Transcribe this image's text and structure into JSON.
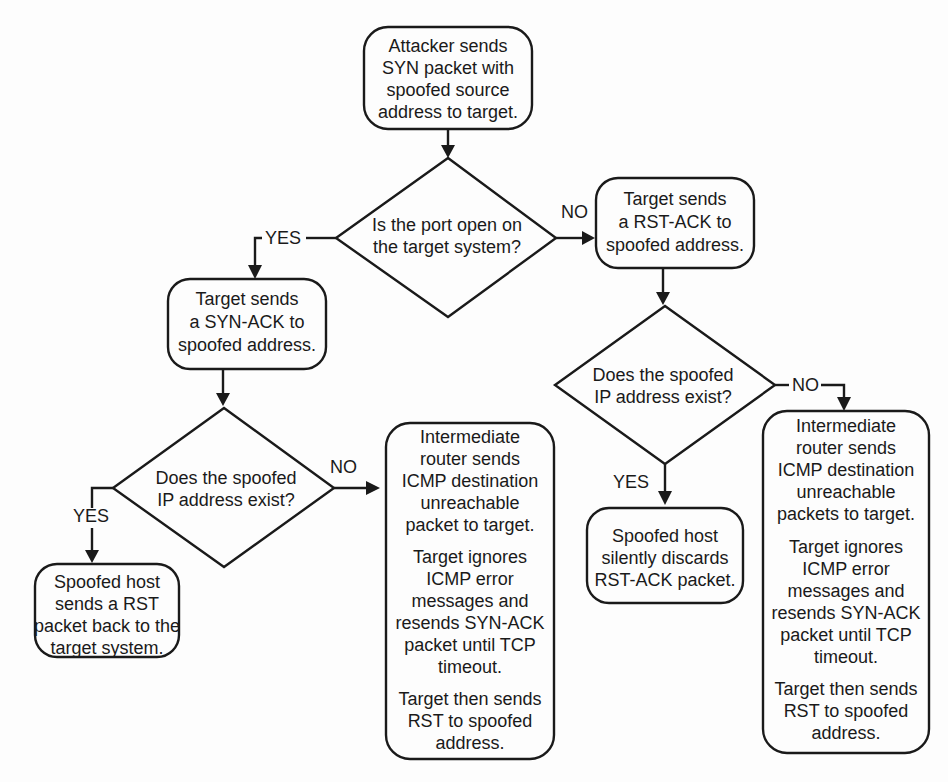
{
  "diagram": {
    "type": "flowchart",
    "start": {
      "lines": [
        "Attacker sends",
        "SYN packet with",
        "spoofed source",
        "address to target."
      ]
    },
    "decision_port_open": {
      "lines": [
        "Is the port open on",
        "the target system?"
      ],
      "yes_label": "YES",
      "no_label": "NO"
    },
    "syn_ack_box": {
      "lines": [
        "Target sends",
        "a SYN-ACK to",
        "spoofed address."
      ]
    },
    "rst_ack_box": {
      "lines": [
        "Target sends",
        "a RST-ACK to",
        "spoofed address."
      ]
    },
    "decision_left_exists": {
      "lines": [
        "Does the spoofed",
        "IP address exist?"
      ],
      "yes_label": "YES",
      "no_label": "NO"
    },
    "decision_right_exists": {
      "lines": [
        "Does the spoofed",
        "IP address exist?"
      ],
      "yes_label": "YES",
      "no_label": "NO"
    },
    "left_yes_result": {
      "lines": [
        "Spoofed host",
        "sends a RST",
        "packet back to the",
        "target system."
      ]
    },
    "left_no_result": {
      "para1": [
        "Intermediate",
        "router sends",
        "ICMP destination",
        "unreachable",
        "packet to target."
      ],
      "para2": [
        "Target ignores",
        "ICMP error",
        "messages and",
        "resends SYN-ACK",
        "packet until TCP",
        "timeout."
      ],
      "para3": [
        "Target then sends",
        "RST to spoofed",
        "address."
      ]
    },
    "right_yes_result": {
      "lines": [
        "Spoofed host",
        "silently discards",
        "RST-ACK packet."
      ]
    },
    "right_no_result": {
      "para1": [
        "Intermediate",
        "router sends",
        "ICMP destination",
        "unreachable",
        "packets to target."
      ],
      "para2": [
        "Target ignores",
        "ICMP error",
        "messages and",
        "resends SYN-ACK",
        "packet until TCP",
        "timeout."
      ],
      "para3": [
        "Target then sends",
        "RST to spoofed",
        "address."
      ]
    }
  }
}
